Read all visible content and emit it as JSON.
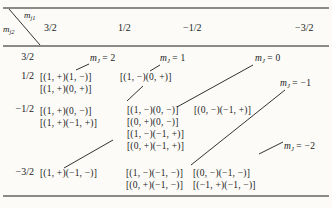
{
  "table": {
    "kind": "jj-coupling product-state table",
    "corner_top": {
      "var": "m",
      "sub": "j1"
    },
    "corner_bottom": {
      "var": "m",
      "sub": "j2"
    },
    "columns": [
      "3/2",
      "1/2",
      "−1/2",
      "−3/2"
    ],
    "rows": [
      "3/2",
      "1/2",
      "−1/2",
      "−3/2"
    ]
  },
  "mj_labels": {
    "p2": {
      "var": "m",
      "sub": "J",
      "rest": "= 2"
    },
    "p1": {
      "var": "m",
      "sub": "J",
      "rest": "= 1"
    },
    "p0": {
      "var": "m",
      "sub": "J",
      "rest": "= 0"
    },
    "m1": {
      "var": "m",
      "sub": "J",
      "rest": "= −1"
    },
    "m2": {
      "var": "m",
      "sub": "J",
      "rest": "= −2"
    }
  },
  "cells": {
    "r1c0": [
      "[(1, +)(1, −)]",
      "[(1, +)(0, +)]"
    ],
    "r1c1": [
      "[(1, −)(0, +)]"
    ],
    "r2c0": [
      "[(1, +)(0, −)]",
      "[(1, +)(−1, +)]"
    ],
    "r2c1": [
      "[(1, −)(0, −)]",
      "[(0, +)(0, −)]",
      "[(1, −)(−1, +)]",
      "[(0, +)(−1, +)]"
    ],
    "r2c2": [
      "[(0, −)(−1, +)]"
    ],
    "r3c0": [
      "[(1, +)(−1, −)]"
    ],
    "r3c1": [
      "[(1, −)(−1, −)]",
      "[(0, +)(−1, −)]"
    ],
    "r3c2": [
      "[(0, −)(−1, −)]",
      "[(−1, +)(−1, −)]"
    ]
  },
  "colors": {
    "ink": "#1b1b1b",
    "paper": "#fcfbf8"
  }
}
